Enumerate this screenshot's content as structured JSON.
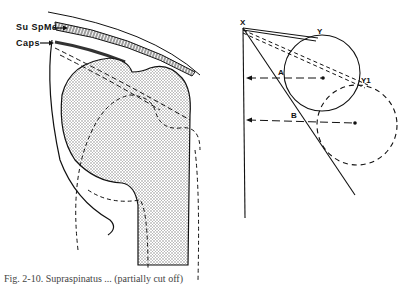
{
  "left_figure": {
    "labels": {
      "supraspinatus": "Su SpMs",
      "capsule": "Caps"
    }
  },
  "right_figure": {
    "points": {
      "x": "X",
      "y": "Y",
      "y1": "Y1",
      "a": "A",
      "b": "B"
    }
  },
  "caption": "Fig. 2-10. Supraspinatus ... (partially cut off)",
  "colors": {
    "ink": "#111111",
    "hatch": "#555555",
    "background": "#ffffff"
  }
}
